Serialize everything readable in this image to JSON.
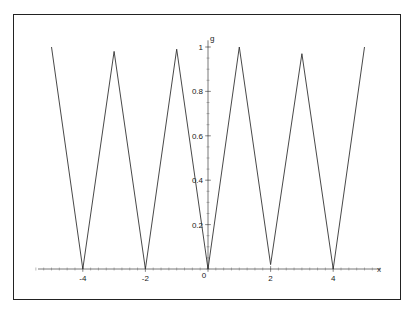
{
  "chart_data": {
    "type": "line",
    "title": "",
    "xlabel": "x",
    "ylabel": "g",
    "xlim": [
      -5,
      5
    ],
    "ylim": [
      0,
      1
    ],
    "grid": false,
    "legend": null,
    "x_ticks": [
      -4,
      -2,
      0,
      2,
      4
    ],
    "x_tick_labels": [
      "-4",
      "-2",
      "0",
      "2",
      "4"
    ],
    "y_ticks": [
      0.2,
      0.4,
      0.6,
      0.8,
      1
    ],
    "y_tick_labels": [
      "0.2",
      "0.4",
      "0.6",
      "0.8",
      "1"
    ],
    "series": [
      {
        "name": "g",
        "x": [
          -5,
          -4,
          -3,
          -2,
          -1,
          0,
          1,
          2,
          3,
          4,
          5
        ],
        "y": [
          1.0,
          0.0,
          0.98,
          0.0,
          0.99,
          0.0,
          1.0,
          0.02,
          0.97,
          0.0,
          1.0
        ]
      }
    ]
  },
  "axes": {
    "x_label": "x",
    "y_label": "g",
    "origin_label": "0"
  }
}
